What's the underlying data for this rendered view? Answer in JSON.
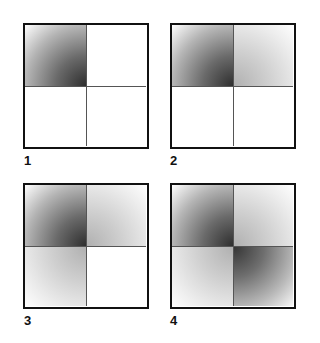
{
  "figure": {
    "panels": [
      {
        "label": "1",
        "quadrants": {
          "top_left": "dark",
          "top_right": "empty",
          "bottom_left": "empty",
          "bottom_right": "empty"
        }
      },
      {
        "label": "2",
        "quadrants": {
          "top_left": "dark",
          "top_right": "light",
          "bottom_left": "empty",
          "bottom_right": "empty"
        }
      },
      {
        "label": "3",
        "quadrants": {
          "top_left": "dark",
          "top_right": "light",
          "bottom_left": "light",
          "bottom_right": "empty"
        }
      },
      {
        "label": "4",
        "quadrants": {
          "top_left": "dark",
          "top_right": "light",
          "bottom_left": "light",
          "bottom_right": "dark"
        }
      }
    ],
    "colors": {
      "frame": "#111111",
      "divider": "#555555",
      "dark_center": "#2e2e2e",
      "light_center": "#b0b0b0",
      "background": "#ffffff"
    }
  }
}
